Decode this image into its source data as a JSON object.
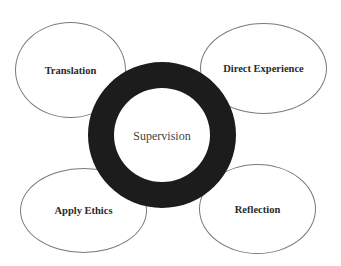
{
  "diagram": {
    "center": {
      "label": "Supervision"
    },
    "nodes": [
      {
        "id": "translation",
        "label": "Translation"
      },
      {
        "id": "direct-experience",
        "label": "Direct Experience"
      },
      {
        "id": "apply-ethics",
        "label": "Apply Ethics"
      },
      {
        "id": "reflection",
        "label": "Reflection"
      }
    ],
    "colors": {
      "ring": "#1c1c1c",
      "ellipse_border": "#7a7a7a",
      "background": "#ffffff"
    }
  }
}
